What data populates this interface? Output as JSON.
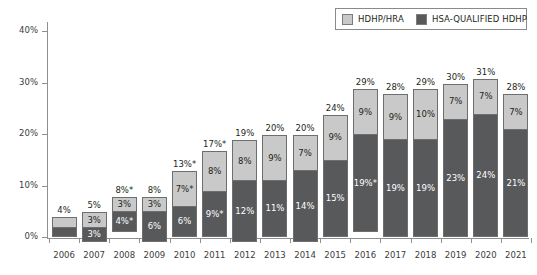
{
  "chart_data": {
    "type": "bar",
    "stacked": true,
    "title": "",
    "xlabel": "",
    "ylabel": "",
    "ylim": [
      0,
      42
    ],
    "grid": false,
    "legend_position": "top-right",
    "categories": [
      "2006",
      "2007",
      "2008",
      "2009",
      "2010",
      "2011",
      "2012",
      "2013",
      "2014",
      "2015",
      "2016",
      "2017",
      "2018",
      "2019",
      "2020",
      "2021"
    ],
    "y_ticks": [
      0,
      10,
      20,
      30,
      40
    ],
    "y_tick_labels": [
      "0%",
      "10%",
      "20%",
      "30%",
      "40%"
    ],
    "series": [
      {
        "name": "HSA-QUALIFIED HDHP",
        "color": "#58595b",
        "values": [
          2,
          3,
          4,
          6,
          6,
          9,
          12,
          11,
          14,
          15,
          19,
          19,
          19,
          23,
          24,
          21
        ],
        "labels": [
          "",
          "3%",
          "4%*",
          "6%",
          "6%",
          "9%*",
          "12%",
          "11%",
          "14%",
          "15%",
          "19%*",
          "19%",
          "19%",
          "23%",
          "24%",
          "21%"
        ]
      },
      {
        "name": "HDHP/HRA",
        "color": "#c9c9c9",
        "values": [
          2,
          3,
          3,
          3,
          7,
          8,
          8,
          9,
          7,
          9,
          9,
          9,
          10,
          7,
          7,
          7
        ],
        "labels": [
          "",
          "3%",
          "3%",
          "3%",
          "7%*",
          "8%",
          "8%",
          "9%",
          "7%",
          "9%",
          "9%",
          "9%",
          "10%",
          "7%",
          "7%",
          "7%"
        ]
      }
    ],
    "totals": [
      4,
      5,
      8,
      8,
      13,
      17,
      19,
      20,
      20,
      24,
      29,
      28,
      29,
      30,
      31,
      28
    ],
    "total_labels": [
      "4%",
      "5%",
      "8%*",
      "8%",
      "13%*",
      "17%*",
      "19%",
      "20%",
      "20%",
      "24%",
      "29%",
      "28%",
      "29%",
      "30%",
      "31%",
      "28%"
    ]
  },
  "legend": {
    "entries": [
      {
        "label": "HDHP/HRA",
        "swatch": "light"
      },
      {
        "label": "HSA-QUALIFIED HDHP",
        "swatch": "dark"
      }
    ]
  }
}
